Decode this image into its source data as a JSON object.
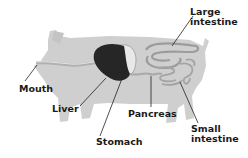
{
  "diagram": {
    "colors": {
      "body": "#cfcfcf",
      "liver": "#262626",
      "stomach": "#e6e6e6",
      "intestine": "#d9d9d9",
      "esophagus": "#b5b5b5",
      "leader_line": "#222222"
    },
    "labels": {
      "large_intestine_line1": "Large",
      "large_intestine_line2": "intestine",
      "mouth": "Mouth",
      "liver": "Liver",
      "pancreas": "Pancreas",
      "stomach": "Stomach",
      "small_intestine_line1": "Small",
      "small_intestine_line2": "intestine"
    }
  }
}
